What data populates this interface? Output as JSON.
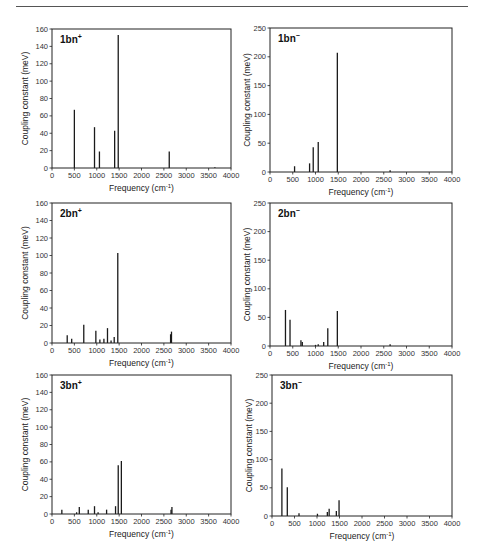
{
  "chart_data": [
    {
      "id": "1bn-plus",
      "type": "bar",
      "label": "1bn",
      "label_sup": "+",
      "xlabel": "Frequency (cm",
      "xlabel_sup": "-1",
      "xlabel_close": ")",
      "ylabel": "Coupling constant (meV)",
      "xlim": [
        0,
        4000
      ],
      "ylim": [
        0,
        160
      ],
      "xticks": [
        0,
        500,
        1000,
        1500,
        2000,
        2500,
        3000,
        3500,
        4000
      ],
      "yticks": [
        0,
        20,
        40,
        60,
        80,
        100,
        120,
        140,
        160
      ],
      "grid": false,
      "box": {
        "left": 52,
        "top": 29,
        "right": 231,
        "bottom": 168
      },
      "x": [
        500,
        950,
        1060,
        1400,
        1480,
        2620,
        3640
      ],
      "values": [
        67,
        47,
        19,
        43,
        153,
        19,
        1
      ]
    },
    {
      "id": "1bn-minus",
      "type": "bar",
      "label": "1bn",
      "label_sup": "−",
      "xlabel": "Frequency (cm",
      "xlabel_sup": "-1",
      "xlabel_close": ")",
      "ylabel": "Coupling constant (meV)",
      "xlim": [
        0,
        4000
      ],
      "ylim": [
        0,
        250
      ],
      "xticks": [
        0,
        500,
        1000,
        1500,
        2000,
        2500,
        3000,
        3500,
        4000
      ],
      "yticks": [
        0,
        50,
        100,
        150,
        200,
        250
      ],
      "grid": false,
      "box": {
        "left": 270,
        "top": 28,
        "right": 452,
        "bottom": 172
      },
      "x": [
        540,
        870,
        950,
        1060,
        1480,
        2640
      ],
      "values": [
        10,
        15,
        43,
        52,
        207,
        3
      ]
    },
    {
      "id": "2bn-plus",
      "type": "bar",
      "label": "2bn",
      "label_sup": "+",
      "xlabel": "Frequency (cm",
      "xlabel_sup": "-1",
      "xlabel_close": ")",
      "ylabel": "Coupling constant (meV)",
      "xlim": [
        0,
        4000
      ],
      "ylim": [
        0,
        160
      ],
      "xticks": [
        0,
        500,
        1000,
        1500,
        2000,
        2500,
        3000,
        3500,
        4000
      ],
      "yticks": [
        0,
        20,
        40,
        60,
        80,
        100,
        120,
        140,
        160
      ],
      "grid": false,
      "box": {
        "left": 52,
        "top": 203,
        "right": 231,
        "bottom": 343
      },
      "x": [
        340,
        440,
        710,
        980,
        1070,
        1160,
        1240,
        1320,
        1390,
        1470,
        2650,
        2670
      ],
      "values": [
        9,
        5,
        21,
        14,
        4,
        5,
        17,
        3,
        7,
        103,
        10,
        13
      ]
    },
    {
      "id": "2bn-minus",
      "type": "bar",
      "label": "2bn",
      "label_sup": "−",
      "xlabel": "Frequency (cm",
      "xlabel_sup": "-1",
      "xlabel_close": ")",
      "ylabel": "Coupling constant (meV)",
      "xlim": [
        0,
        4000
      ],
      "ylim": [
        0,
        250
      ],
      "xticks": [
        0,
        500,
        1000,
        1500,
        2000,
        2500,
        3000,
        3500,
        4000
      ],
      "yticks": [
        0,
        50,
        100,
        150,
        200,
        250
      ],
      "grid": false,
      "box": {
        "left": 270,
        "top": 203,
        "right": 452,
        "bottom": 346
      },
      "x": [
        340,
        440,
        680,
        710,
        1000,
        1060,
        1180,
        1270,
        1480,
        2640
      ],
      "values": [
        63,
        46,
        10,
        7,
        2,
        3,
        7,
        31,
        61,
        3
      ]
    },
    {
      "id": "3bn-plus",
      "type": "bar",
      "label": "3bn",
      "label_sup": "+",
      "xlabel": "Frequency (cm",
      "xlabel_sup": "-1",
      "xlabel_close": ")",
      "ylabel": "Coupling constant (meV)",
      "xlim": [
        0,
        4000
      ],
      "ylim": [
        0,
        160
      ],
      "xticks": [
        0,
        500,
        1000,
        1500,
        2000,
        2500,
        3000,
        3500,
        4000
      ],
      "yticks": [
        0,
        20,
        40,
        60,
        80,
        100,
        120,
        140,
        160
      ],
      "grid": false,
      "box": {
        "left": 52,
        "top": 375,
        "right": 231,
        "bottom": 514
      },
      "x": [
        220,
        550,
        610,
        810,
        950,
        1030,
        1220,
        1420,
        1480,
        1550,
        2660,
        2680
      ],
      "values": [
        5,
        2,
        8,
        5,
        9,
        2,
        5,
        9,
        56,
        61,
        5,
        8
      ]
    },
    {
      "id": "3bn-minus",
      "type": "bar",
      "label": "3bn",
      "label_sup": "−",
      "xlabel": "Frequency (cm",
      "xlabel_sup": "-1",
      "xlabel_close": ")",
      "ylabel": "Coupling constant (meV)",
      "xlim": [
        0,
        4000
      ],
      "ylim": [
        0,
        250
      ],
      "xticks": [
        0,
        500,
        1000,
        1500,
        2000,
        2500,
        3000,
        3500,
        4000
      ],
      "yticks": [
        0,
        50,
        100,
        150,
        200,
        250
      ],
      "grid": false,
      "box": {
        "left": 272,
        "top": 375,
        "right": 452,
        "bottom": 516
      },
      "x": [
        220,
        340,
        600,
        1010,
        1230,
        1270,
        1430,
        1490
      ],
      "values": [
        84,
        51,
        5,
        4,
        7,
        13,
        9,
        28
      ]
    }
  ]
}
